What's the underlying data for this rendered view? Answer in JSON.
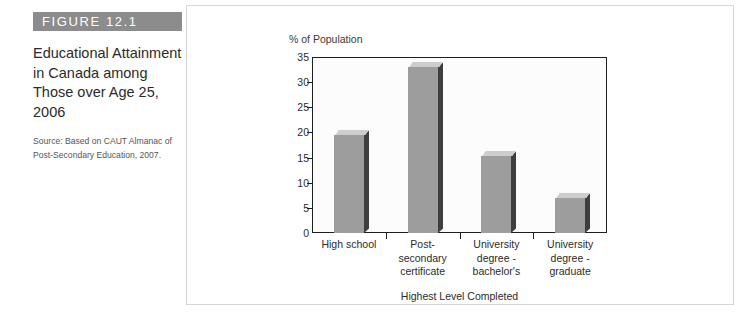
{
  "figure": {
    "banner_label": "FIGURE 12.1",
    "title": "Educational Attainment in Canada among Those over Age 25, 2006",
    "source": "Source: Based on CAUT Almanac of Post-Secondary Education, 2007.",
    "banner_color": "#8c8c8c",
    "bar_color": "#9d9d9d",
    "bar_top_color": "#cdcdcd",
    "bar_side_color": "#3e3e3e",
    "panel_border_color": "#d6d6d6",
    "axis_color": "#1f1f1f"
  },
  "chart_data": {
    "type": "bar",
    "title": "",
    "categories": [
      "High school",
      "Post-secondary certificate",
      "University degree - bachelor's",
      "University degree - graduate"
    ],
    "category_lines": [
      [
        "High school"
      ],
      [
        "Post-",
        "secondary",
        "certificate"
      ],
      [
        "University",
        "degree -",
        "bachelor's"
      ],
      [
        "University",
        "degree -",
        "graduate"
      ]
    ],
    "values": [
      19.5,
      33,
      15.3,
      7
    ],
    "xlabel": "Highest Level Completed",
    "ylabel": "% of Population",
    "ylim": [
      0,
      35
    ],
    "ytick_step": 5,
    "yticks": [
      0,
      5,
      10,
      15,
      20,
      25,
      30,
      35
    ],
    "ytick_labels": [
      "0",
      "5",
      "10",
      "15",
      "20",
      "25",
      "30",
      "35"
    ],
    "grid": false,
    "legend": false
  }
}
